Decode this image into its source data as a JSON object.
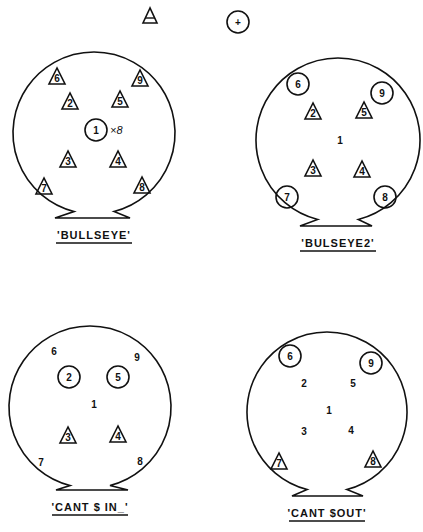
{
  "legend": {
    "triangle_symbol": "triangle-marker",
    "circle_symbol": "circle-plus-marker",
    "circle_glyph": "+"
  },
  "diagrams": [
    {
      "title": "'BULLSEYE'",
      "center": [
        94,
        133
      ],
      "radius": 81,
      "flat_bottom": [
        55,
        218,
        130
      ],
      "positions": [
        {
          "label": "1",
          "x": 96,
          "y": 130,
          "marker": "circle"
        },
        {
          "label": "2",
          "x": 70,
          "y": 103,
          "marker": "triangle"
        },
        {
          "label": "3",
          "x": 68,
          "y": 161,
          "marker": "triangle"
        },
        {
          "label": "4",
          "x": 118,
          "y": 161,
          "marker": "triangle"
        },
        {
          "label": "5",
          "x": 120,
          "y": 101,
          "marker": "triangle"
        },
        {
          "label": "6",
          "x": 57,
          "y": 78,
          "marker": "triangle"
        },
        {
          "label": "7",
          "x": 44,
          "y": 188,
          "marker": "triangle"
        },
        {
          "label": "8",
          "x": 142,
          "y": 187,
          "marker": "triangle"
        },
        {
          "label": "9",
          "x": 140,
          "y": 80,
          "marker": "triangle"
        }
      ],
      "annotation": "×8"
    },
    {
      "title": "'BULSEYE2'",
      "center": [
        338,
        140
      ],
      "radius": 82,
      "flat_bottom": [
        300,
        226,
        372
      ],
      "positions": [
        {
          "label": "1",
          "x": 340,
          "y": 140,
          "marker": "none"
        },
        {
          "label": "2",
          "x": 313,
          "y": 113,
          "marker": "triangle"
        },
        {
          "label": "3",
          "x": 313,
          "y": 170,
          "marker": "triangle"
        },
        {
          "label": "4",
          "x": 362,
          "y": 171,
          "marker": "triangle"
        },
        {
          "label": "5",
          "x": 364,
          "y": 112,
          "marker": "triangle"
        },
        {
          "label": "6",
          "x": 298,
          "y": 84,
          "marker": "circle"
        },
        {
          "label": "7",
          "x": 287,
          "y": 197,
          "marker": "circle"
        },
        {
          "label": "8",
          "x": 385,
          "y": 197,
          "marker": "circle"
        },
        {
          "label": "9",
          "x": 382,
          "y": 93,
          "marker": "circle"
        }
      ]
    },
    {
      "title": "'CANT $ IN_'",
      "center": [
        90,
        407
      ],
      "radius": 81,
      "flat_bottom": [
        56,
        490,
        128
      ],
      "positions": [
        {
          "label": "1",
          "x": 94,
          "y": 404,
          "marker": "none"
        },
        {
          "label": "2",
          "x": 69,
          "y": 377,
          "marker": "circle"
        },
        {
          "label": "3",
          "x": 68,
          "y": 437,
          "marker": "triangle"
        },
        {
          "label": "4",
          "x": 118,
          "y": 436,
          "marker": "triangle"
        },
        {
          "label": "5",
          "x": 118,
          "y": 377,
          "marker": "circle"
        },
        {
          "label": "6",
          "x": 54,
          "y": 351,
          "marker": "none"
        },
        {
          "label": "7",
          "x": 41,
          "y": 462,
          "marker": "none"
        },
        {
          "label": "8",
          "x": 140,
          "y": 461,
          "marker": "none"
        },
        {
          "label": "9",
          "x": 137,
          "y": 357,
          "marker": "none"
        }
      ]
    },
    {
      "title": "'CANT $OUT'",
      "center": [
        327,
        412
      ],
      "radius": 80,
      "flat_bottom": [
        292,
        496,
        363
      ],
      "positions": [
        {
          "label": "1",
          "x": 329,
          "y": 410,
          "marker": "none"
        },
        {
          "label": "2",
          "x": 304,
          "y": 383,
          "marker": "none"
        },
        {
          "label": "3",
          "x": 304,
          "y": 431,
          "marker": "none"
        },
        {
          "label": "4",
          "x": 351,
          "y": 430,
          "marker": "none"
        },
        {
          "label": "5",
          "x": 353,
          "y": 383,
          "marker": "none"
        },
        {
          "label": "6",
          "x": 290,
          "y": 356,
          "marker": "circle"
        },
        {
          "label": "7",
          "x": 279,
          "y": 463,
          "marker": "triangle"
        },
        {
          "label": "8",
          "x": 373,
          "y": 461,
          "marker": "triangle"
        },
        {
          "label": "9",
          "x": 371,
          "y": 363,
          "marker": "circle"
        }
      ]
    }
  ]
}
